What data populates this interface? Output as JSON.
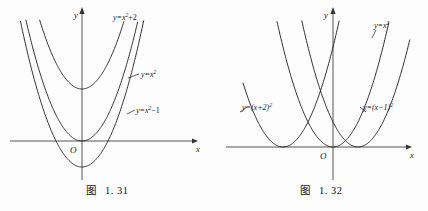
{
  "page": {
    "background_color": "#fdfdfd",
    "ink_color": "#1a1a1a",
    "axis_color": "#555555"
  },
  "figures": [
    {
      "id": "figure-1-31",
      "caption_word": "图",
      "caption_number": "1. 31",
      "axis": {
        "x_label": "x",
        "y_label": "y",
        "origin_label": "O"
      },
      "labels": {
        "c1_pre": "y=x",
        "c1_sup": "2",
        "c1_post": "+2",
        "c2_pre": "y=x",
        "c2_sup": "2",
        "c2_post": "",
        "c3_pre": "y=x",
        "c3_sup": "2",
        "c3_post": "−1"
      }
    },
    {
      "id": "figure-1-32",
      "caption_word": "图",
      "caption_number": "1. 32",
      "axis": {
        "x_label": "x",
        "y_label": "y",
        "origin_label": "O"
      },
      "labels": {
        "c1_pre": "y=(x+2)",
        "c1_sup": "2",
        "c1_post": "",
        "c2_pre": "y=x",
        "c2_sup": "2",
        "c2_post": "",
        "c3_pre": "y=(x−1)",
        "c3_sup": "2",
        "c3_post": ""
      }
    }
  ],
  "chart_data": [
    {
      "type": "line",
      "title": "图 1. 31",
      "xlabel": "x",
      "ylabel": "y",
      "xlim": [
        -2.6,
        2.9
      ],
      "ylim": [
        -1.6,
        5.2
      ],
      "grid": false,
      "legend": "inline-annotations",
      "origin_label": "O",
      "series": [
        {
          "name": "y=x^2+2",
          "label": "y=x²+2",
          "formula": "x^2 + 2",
          "a": 1,
          "h": 0,
          "k": 2,
          "vertex": [
            0,
            2
          ]
        },
        {
          "name": "y=x^2",
          "label": "y=x²",
          "formula": "x^2",
          "a": 1,
          "h": 0,
          "k": 0,
          "vertex": [
            0,
            0
          ]
        },
        {
          "name": "y=x^2-1",
          "label": "y=x²−1",
          "formula": "x^2 - 1",
          "a": 1,
          "h": 0,
          "k": -1,
          "vertex": [
            0,
            -1
          ]
        }
      ]
    },
    {
      "type": "line",
      "title": "图 1. 32",
      "xlabel": "x",
      "ylabel": "y",
      "xlim": [
        -3.6,
        3.2
      ],
      "ylim": [
        -0.9,
        6.2
      ],
      "grid": false,
      "legend": "inline-annotations",
      "origin_label": "O",
      "series": [
        {
          "name": "y=(x+2)^2",
          "label": "y=(x+2)²",
          "formula": "(x + 2)^2",
          "a": 1,
          "h": -2,
          "k": 0,
          "vertex": [
            -2,
            0
          ]
        },
        {
          "name": "y=x^2",
          "label": "y=x²",
          "formula": "x^2",
          "a": 1,
          "h": 0,
          "k": 0,
          "vertex": [
            0,
            0
          ]
        },
        {
          "name": "y=(x-1)^2",
          "label": "y=(x−1)²",
          "formula": "(x - 1)^2",
          "a": 1,
          "h": 1,
          "k": 0,
          "vertex": [
            1,
            0
          ]
        }
      ]
    }
  ]
}
